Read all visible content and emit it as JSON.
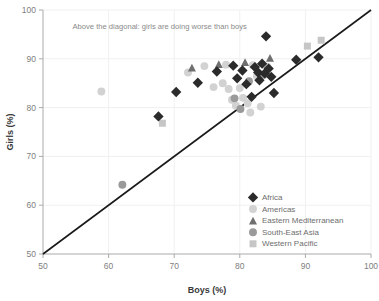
{
  "chart_data": {
    "type": "scatter",
    "title": "",
    "xlabel": "Boys (%)",
    "ylabel": "Girls (%)",
    "xlim": [
      50,
      100
    ],
    "ylim": [
      50,
      100
    ],
    "xticks": [
      50,
      60,
      70,
      80,
      90,
      100
    ],
    "yticks": [
      50,
      60,
      70,
      80,
      90,
      100
    ],
    "grid": true,
    "legend_position": "bottom-right",
    "annotations": [
      {
        "text": "Above the diagonal: girls are doing worse than boys",
        "x": 54.5,
        "y": 96.2
      }
    ],
    "reference_line": {
      "label": "diagonal",
      "from": [
        50,
        50
      ],
      "to": [
        100,
        100
      ],
      "color": "#1a1a1a"
    },
    "series": [
      {
        "name": "Africa",
        "marker": "diamond",
        "color": "#2b2b2b",
        "points": [
          {
            "x": 67.6,
            "y": 78.2
          },
          {
            "x": 70.3,
            "y": 83.2
          },
          {
            "x": 73.6,
            "y": 85.1
          },
          {
            "x": 76.5,
            "y": 87.4
          },
          {
            "x": 79.0,
            "y": 88.6
          },
          {
            "x": 79.6,
            "y": 86.0
          },
          {
            "x": 80.4,
            "y": 87.6
          },
          {
            "x": 81.0,
            "y": 84.8
          },
          {
            "x": 81.8,
            "y": 82.2
          },
          {
            "x": 82.3,
            "y": 88.3
          },
          {
            "x": 82.8,
            "y": 87.2
          },
          {
            "x": 83.0,
            "y": 85.6
          },
          {
            "x": 83.4,
            "y": 89.0
          },
          {
            "x": 83.8,
            "y": 87.0
          },
          {
            "x": 84.0,
            "y": 94.6
          },
          {
            "x": 84.4,
            "y": 88.0
          },
          {
            "x": 84.8,
            "y": 86.3
          },
          {
            "x": 85.2,
            "y": 83.0
          },
          {
            "x": 88.6,
            "y": 89.8
          },
          {
            "x": 92.0,
            "y": 90.3
          }
        ]
      },
      {
        "name": "Americas",
        "marker": "circle",
        "color": "#d2d2d2",
        "points": [
          {
            "x": 58.9,
            "y": 83.3
          },
          {
            "x": 72.1,
            "y": 87.2
          },
          {
            "x": 74.6,
            "y": 88.5
          },
          {
            "x": 76.0,
            "y": 84.2
          },
          {
            "x": 77.4,
            "y": 85.0
          },
          {
            "x": 77.9,
            "y": 88.8
          },
          {
            "x": 78.3,
            "y": 83.8
          },
          {
            "x": 78.8,
            "y": 81.6
          },
          {
            "x": 79.4,
            "y": 80.4
          },
          {
            "x": 80.0,
            "y": 84.0
          },
          {
            "x": 80.5,
            "y": 82.0
          },
          {
            "x": 81.2,
            "y": 80.9
          },
          {
            "x": 81.6,
            "y": 79.0
          },
          {
            "x": 82.0,
            "y": 88.7
          },
          {
            "x": 82.6,
            "y": 86.4
          },
          {
            "x": 83.2,
            "y": 80.2
          },
          {
            "x": 84.2,
            "y": 88.4
          }
        ]
      },
      {
        "name": "Eastern Mediterranean",
        "marker": "triangle",
        "color": "#6f6f6f",
        "points": [
          {
            "x": 72.7,
            "y": 88.2
          },
          {
            "x": 76.8,
            "y": 88.9
          },
          {
            "x": 80.8,
            "y": 89.3
          },
          {
            "x": 84.6,
            "y": 90.2
          }
        ]
      },
      {
        "name": "South-East Asia",
        "marker": "circle",
        "color": "#9a9a9a",
        "points": [
          {
            "x": 62.1,
            "y": 64.2
          },
          {
            "x": 79.2,
            "y": 81.9
          },
          {
            "x": 80.1,
            "y": 79.7
          },
          {
            "x": 81.4,
            "y": 85.4
          },
          {
            "x": 83.6,
            "y": 86.7
          }
        ]
      },
      {
        "name": "Western Pacific",
        "marker": "square",
        "color": "#c6c6c6",
        "points": [
          {
            "x": 68.2,
            "y": 76.8
          },
          {
            "x": 90.3,
            "y": 92.6
          },
          {
            "x": 92.4,
            "y": 93.8
          }
        ]
      }
    ]
  },
  "cropped_header": {
    "text": "",
    "visible": false
  }
}
